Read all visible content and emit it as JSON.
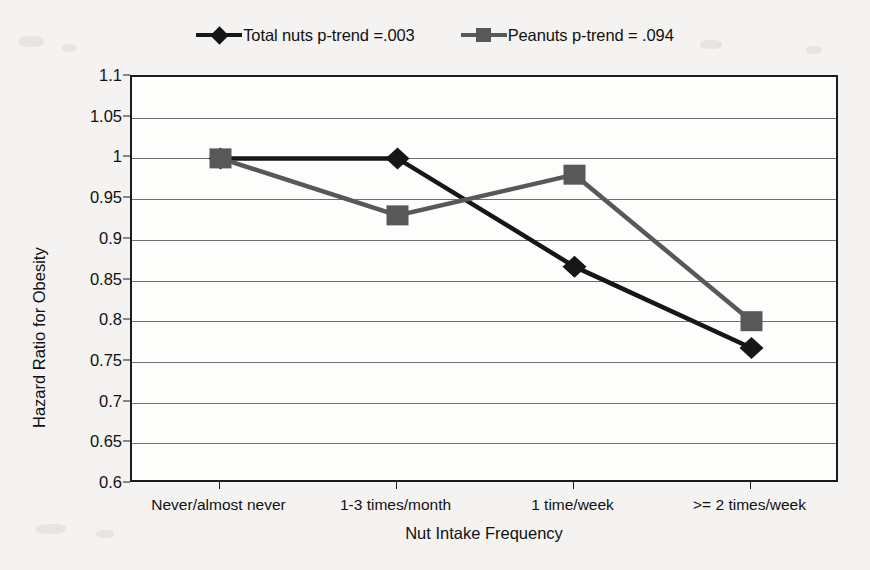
{
  "chart_data": {
    "type": "line",
    "title": "",
    "xlabel": "Nut Intake Frequency",
    "ylabel": "Hazard Ratio for Obesity",
    "categories": [
      "Never/almost never",
      "1-3 times/month",
      "1 time/week",
      ">= 2 times/week"
    ],
    "ylim": [
      0.6,
      1.1
    ],
    "yticks": [
      "0.6",
      "0.65",
      "0.7",
      "0.75",
      "0.8",
      "0.85",
      "0.9",
      "0.95",
      "1",
      "1.05",
      "1.1"
    ],
    "ytick_values": [
      0.6,
      0.65,
      0.7,
      0.75,
      0.8,
      0.85,
      0.9,
      0.95,
      1.0,
      1.05,
      1.1
    ],
    "grid": true,
    "legend_position": "top-center",
    "series": [
      {
        "name": "Total nuts p-trend =.003",
        "marker": "diamond",
        "color": "#161616",
        "values": [
          1.0,
          1.0,
          0.867,
          0.767
        ]
      },
      {
        "name": "Peanuts p-trend = .094",
        "marker": "square",
        "color": "#585858",
        "values": [
          1.0,
          0.93,
          0.98,
          0.8
        ]
      }
    ]
  },
  "legend": {
    "entries": [
      {
        "label": "Total nuts p-trend =.003",
        "marker": "diamond-marker-icon",
        "color": "#161616"
      },
      {
        "label": "Peanuts p-trend = .094",
        "marker": "square-marker-icon",
        "color": "#585858"
      }
    ]
  },
  "axes": {
    "y_title": "Hazard Ratio for Obesity",
    "x_title": "Nut Intake Frequency"
  }
}
